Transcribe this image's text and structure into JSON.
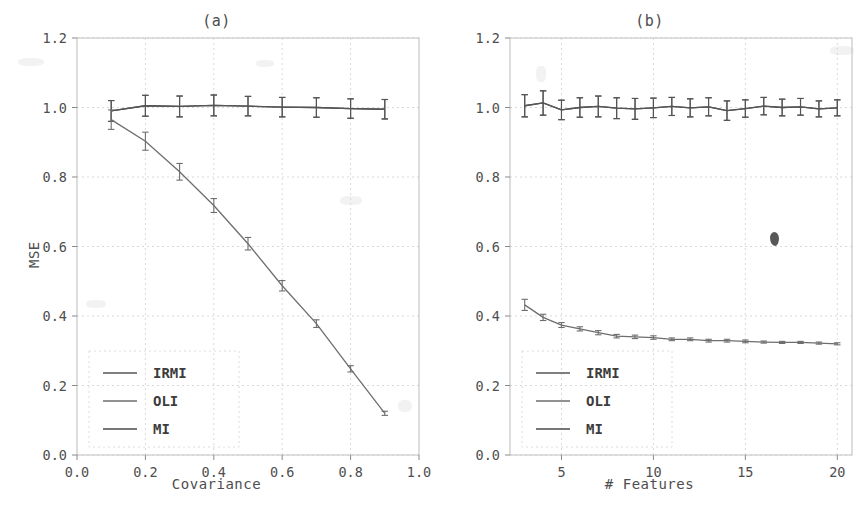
{
  "figure": {
    "background_color": "#ffffff",
    "ink_color": "#4a4a4a",
    "grid_color": "#d9d9d9",
    "panel_count": 2,
    "artifact_label": "scan-smudge"
  },
  "chart_data": [
    {
      "type": "line",
      "title": "(a)",
      "xlabel": "Covariance",
      "ylabel": "MSE",
      "xlim": [
        0.0,
        1.0
      ],
      "ylim": [
        0.0,
        1.2
      ],
      "xticks": [
        0.0,
        0.2,
        0.4,
        0.6,
        0.8,
        1.0
      ],
      "xticklabels": [
        "0.0",
        "0.2",
        "0.4",
        "0.6",
        "0.8",
        "1.0"
      ],
      "yticks": [
        0.0,
        0.2,
        0.4,
        0.6,
        0.8,
        1.0,
        1.2
      ],
      "yticklabels": [
        "0.0",
        "0.2",
        "0.4",
        "0.6",
        "0.8",
        "1.0",
        "1.2"
      ],
      "grid": true,
      "legend_position": "lower left",
      "legend_entries": [
        "IRMI",
        "OLI",
        "MI"
      ],
      "x": [
        0.1,
        0.2,
        0.3,
        0.4,
        0.5,
        0.6,
        0.7,
        0.8,
        0.9
      ],
      "series": [
        {
          "name": "IRMI",
          "color": "#555555",
          "values": [
            0.99,
            1.005,
            1.003,
            1.006,
            1.004,
            1.001,
            1.0,
            0.997,
            0.995
          ],
          "errors": [
            0.03,
            0.03,
            0.03,
            0.03,
            0.028,
            0.028,
            0.028,
            0.028,
            0.028
          ]
        },
        {
          "name": "OLI",
          "color": "#6e6e6e",
          "values": [
            0.965,
            0.903,
            0.815,
            0.718,
            0.608,
            0.487,
            0.378,
            0.248,
            0.12
          ],
          "errors": [
            0.028,
            0.026,
            0.024,
            0.02,
            0.018,
            0.015,
            0.011,
            0.009,
            0.006
          ]
        },
        {
          "name": "MI",
          "color": "#4a4a4a",
          "values": [
            0.99,
            1.005,
            1.003,
            1.006,
            1.004,
            1.001,
            1.0,
            0.997,
            0.995
          ],
          "errors": [
            0.03,
            0.03,
            0.03,
            0.03,
            0.028,
            0.028,
            0.028,
            0.028,
            0.028
          ]
        }
      ]
    },
    {
      "type": "line",
      "title": "(b)",
      "xlabel": "# Features",
      "ylabel": "MSE",
      "xlim": [
        2.2,
        20.8
      ],
      "ylim": [
        0.0,
        1.2
      ],
      "xticks": [
        5,
        10,
        15,
        20
      ],
      "xticklabels": [
        "5",
        "10",
        "15",
        "20"
      ],
      "yticks": [
        0.0,
        0.2,
        0.4,
        0.6,
        0.8,
        1.0,
        1.2
      ],
      "yticklabels": [
        "0.0",
        "0.2",
        "0.4",
        "0.6",
        "0.8",
        "1.0",
        "1.2"
      ],
      "grid": true,
      "legend_position": "lower left",
      "legend_entries": [
        "IRMI",
        "OLI",
        "MI"
      ],
      "x": [
        3,
        4,
        5,
        6,
        7,
        8,
        9,
        10,
        11,
        12,
        13,
        14,
        15,
        16,
        17,
        18,
        19,
        20
      ],
      "series": [
        {
          "name": "IRMI",
          "color": "#555555",
          "values": [
            1.005,
            1.013,
            0.993,
            1.0,
            1.003,
            0.998,
            0.996,
            0.999,
            1.003,
            0.999,
            1.002,
            0.991,
            0.997,
            1.004,
            1.0,
            1.002,
            0.996,
            0.999
          ],
          "errors": [
            0.032,
            0.035,
            0.028,
            0.028,
            0.03,
            0.03,
            0.03,
            0.028,
            0.026,
            0.026,
            0.026,
            0.028,
            0.025,
            0.025,
            0.024,
            0.024,
            0.023,
            0.023
          ]
        },
        {
          "name": "OLI",
          "color": "#6e6e6e",
          "values": [
            0.432,
            0.396,
            0.374,
            0.363,
            0.352,
            0.342,
            0.34,
            0.338,
            0.333,
            0.333,
            0.329,
            0.329,
            0.327,
            0.325,
            0.324,
            0.324,
            0.322,
            0.32
          ],
          "errors": [
            0.016,
            0.009,
            0.007,
            0.006,
            0.006,
            0.005,
            0.005,
            0.005,
            0.004,
            0.004,
            0.004,
            0.004,
            0.004,
            0.003,
            0.003,
            0.003,
            0.003,
            0.003
          ]
        },
        {
          "name": "MI",
          "color": "#4a4a4a",
          "values": [
            1.005,
            1.013,
            0.993,
            1.0,
            1.003,
            0.998,
            0.996,
            0.999,
            1.003,
            0.999,
            1.002,
            0.991,
            0.997,
            1.004,
            1.0,
            1.002,
            0.996,
            0.999
          ],
          "errors": [
            0.032,
            0.035,
            0.028,
            0.028,
            0.03,
            0.03,
            0.03,
            0.028,
            0.026,
            0.026,
            0.026,
            0.028,
            0.025,
            0.025,
            0.024,
            0.024,
            0.023,
            0.023
          ]
        }
      ]
    }
  ]
}
